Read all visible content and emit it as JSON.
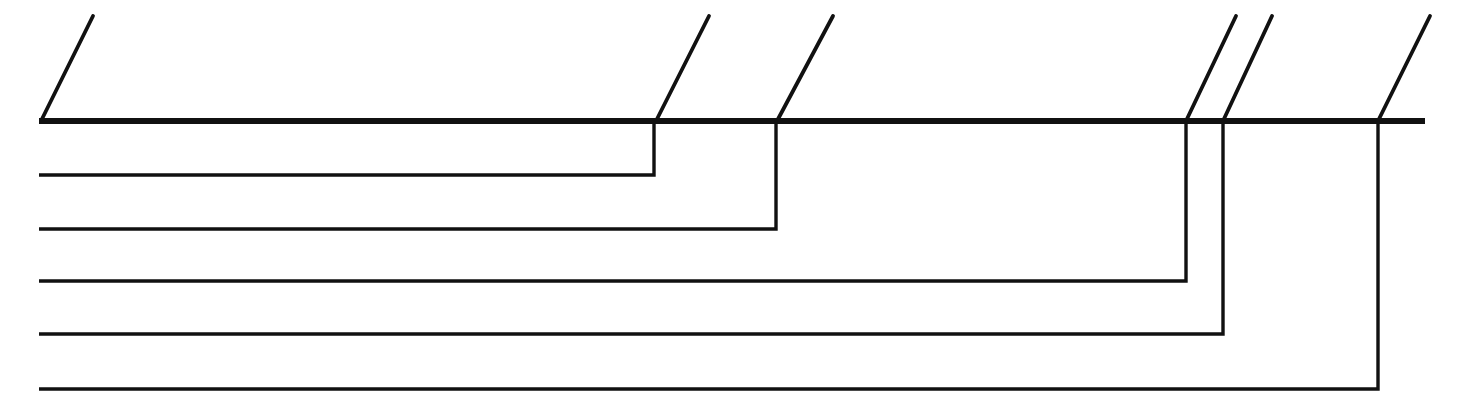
{
  "figure": {
    "type": "line-drawing",
    "width": 1467,
    "height": 410,
    "background_color": "#ffffff",
    "ink_color": "#111111"
  },
  "chart_data": {
    "type": "line",
    "xlabel": "",
    "ylabel": "",
    "xlim": [
      0,
      1467
    ],
    "ylim": [
      410,
      0
    ],
    "grid": false,
    "legend": "none",
    "spine": {
      "name": "main-horizontal-spine",
      "x_start": 39,
      "x_end": 1425,
      "y": 121,
      "stroke_width": 6.2
    },
    "left_margin_x": 39,
    "leader_ticks": [
      {
        "id": "tick-1",
        "x_base": 41,
        "y_base": 121,
        "x_tip": 93,
        "y_tip": 16
      },
      {
        "id": "tick-2",
        "x_base": 656,
        "y_base": 121,
        "x_tip": 709,
        "y_tip": 16
      },
      {
        "id": "tick-3",
        "x_base": 777,
        "y_base": 121,
        "x_tip": 833,
        "y_tip": 16
      },
      {
        "id": "tick-4",
        "x_base": 1186,
        "y_base": 121,
        "x_tip": 1236,
        "y_tip": 16
      },
      {
        "id": "tick-5",
        "x_base": 1223,
        "y_base": 121,
        "x_tip": 1272,
        "y_tip": 16
      },
      {
        "id": "tick-6",
        "x_base": 1378,
        "y_base": 121,
        "x_tip": 1430,
        "y_tip": 16
      }
    ],
    "branches": [
      {
        "id": "branch-1",
        "drop_x": 654,
        "y": 175,
        "x_left": 39,
        "from_y": 121
      },
      {
        "id": "branch-2",
        "drop_x": 776,
        "y": 229,
        "x_left": 39,
        "from_y": 121
      },
      {
        "id": "branch-3",
        "drop_x": 1186,
        "y": 281,
        "x_left": 39,
        "from_y": 121
      },
      {
        "id": "branch-4",
        "drop_x": 1223,
        "y": 334,
        "x_left": 39,
        "from_y": 121
      },
      {
        "id": "branch-5",
        "drop_x": 1378,
        "y": 389,
        "x_left": 39,
        "from_y": 121
      }
    ],
    "branch_count": 5,
    "tick_count": 6
  }
}
